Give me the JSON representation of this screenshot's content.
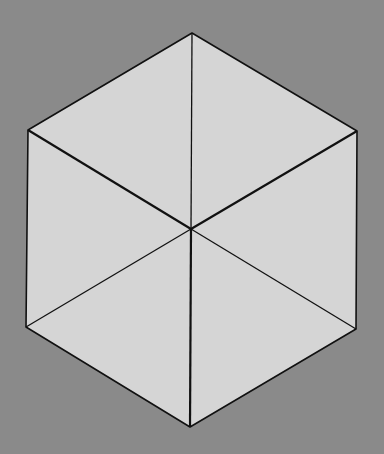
{
  "diagram": {
    "type": "hexagon-subdivided-into-six-triangles",
    "background_color": "#8a8a8a",
    "face_color": "#d5d5d5",
    "line_color": "#111111",
    "center": [
      191,
      229
    ],
    "vertices": [
      [
        192,
        33
      ],
      [
        357,
        131
      ],
      [
        356,
        329
      ],
      [
        190,
        427
      ],
      [
        26,
        327
      ],
      [
        28,
        130
      ]
    ]
  }
}
